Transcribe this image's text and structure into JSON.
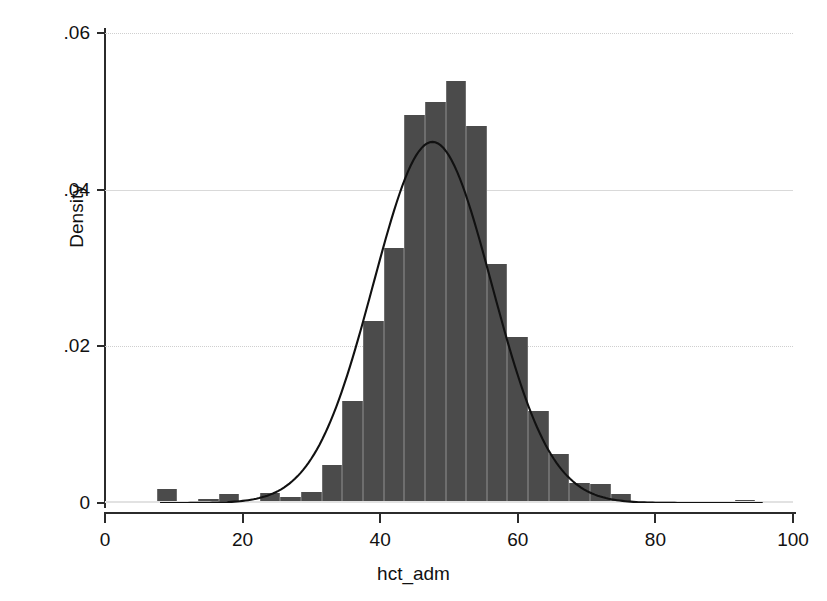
{
  "chart_data": {
    "type": "bar",
    "title": "",
    "subtitle": "",
    "xlabel": "hct_adm",
    "ylabel": "Density",
    "xlim": [
      0,
      100
    ],
    "ylim": [
      0,
      0.06
    ],
    "grid": true,
    "legend": null,
    "bin_width": 3,
    "x_ticks": [
      0,
      20,
      40,
      60,
      80,
      100
    ],
    "x_tick_labels": [
      "0",
      "20",
      "40",
      "60",
      "80",
      "100"
    ],
    "y_ticks": [
      0,
      0.02,
      0.04,
      0.06
    ],
    "y_tick_labels": [
      "0",
      ".02",
      ".04",
      ".06"
    ],
    "bars": [
      {
        "bin_start": 7.5,
        "bin_end": 10.5,
        "value": 0.0018
      },
      {
        "bin_start": 10.5,
        "bin_end": 13.5,
        "value": 0.0
      },
      {
        "bin_start": 13.5,
        "bin_end": 16.5,
        "value": 0.0005
      },
      {
        "bin_start": 16.5,
        "bin_end": 19.5,
        "value": 0.0011
      },
      {
        "bin_start": 19.5,
        "bin_end": 22.5,
        "value": 0.0
      },
      {
        "bin_start": 22.5,
        "bin_end": 25.5,
        "value": 0.0013
      },
      {
        "bin_start": 25.5,
        "bin_end": 28.5,
        "value": 0.0008
      },
      {
        "bin_start": 28.5,
        "bin_end": 31.5,
        "value": 0.0014
      },
      {
        "bin_start": 31.5,
        "bin_end": 34.5,
        "value": 0.0048
      },
      {
        "bin_start": 34.5,
        "bin_end": 37.5,
        "value": 0.013
      },
      {
        "bin_start": 37.5,
        "bin_end": 40.5,
        "value": 0.0232
      },
      {
        "bin_start": 40.5,
        "bin_end": 43.5,
        "value": 0.0326
      },
      {
        "bin_start": 43.5,
        "bin_end": 46.5,
        "value": 0.0495
      },
      {
        "bin_start": 46.5,
        "bin_end": 49.5,
        "value": 0.0512
      },
      {
        "bin_start": 49.5,
        "bin_end": 52.5,
        "value": 0.0539
      },
      {
        "bin_start": 52.5,
        "bin_end": 55.5,
        "value": 0.0481
      },
      {
        "bin_start": 55.5,
        "bin_end": 58.5,
        "value": 0.0305
      },
      {
        "bin_start": 58.5,
        "bin_end": 61.5,
        "value": 0.0212
      },
      {
        "bin_start": 61.5,
        "bin_end": 64.5,
        "value": 0.0118
      },
      {
        "bin_start": 64.5,
        "bin_end": 67.5,
        "value": 0.0063
      },
      {
        "bin_start": 67.5,
        "bin_end": 70.5,
        "value": 0.0025
      },
      {
        "bin_start": 70.5,
        "bin_end": 73.5,
        "value": 0.0024
      },
      {
        "bin_start": 73.5,
        "bin_end": 76.5,
        "value": 0.0011
      },
      {
        "bin_start": 76.5,
        "bin_end": 79.5,
        "value": 0.0
      },
      {
        "bin_start": 91.5,
        "bin_end": 94.5,
        "value": 0.0004
      }
    ],
    "normal_curve": {
      "label": "normal density overlay",
      "mean": 47.6,
      "sd": 8.6,
      "peak_value": 0.0461,
      "x_start": 8,
      "x_end": 96
    }
  }
}
